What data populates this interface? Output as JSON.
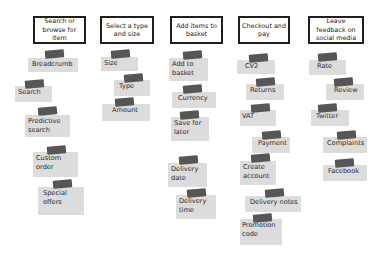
{
  "columns": [
    {
      "header": "Search or browse for item",
      "cards": [
        "Breadcrumb",
        "Search",
        "Predictive search",
        "Custom order",
        "Special offers"
      ]
    },
    {
      "header": "Select a type and size",
      "cards": [
        "Size",
        "Type",
        "Amount"
      ]
    },
    {
      "header": "Add items to basket",
      "cards": [
        "Add to basket",
        "Currency",
        "Save for later",
        "Delivery date",
        "Delivery time"
      ]
    },
    {
      "header": "Checkout and pay",
      "cards": [
        "CV2",
        "Returns",
        "VAT",
        "Payment",
        "Create account",
        "Delivery notes",
        "Promotion code"
      ]
    },
    {
      "header": "Leave feedback on social media",
      "cards": [
        "Rate",
        "Review",
        "Twitter",
        "Complaints",
        "Facebook"
      ]
    }
  ],
  "colors": {
    "header_border": "#1e1e1e",
    "sticky": "#dcdcdc",
    "tape": "#565656"
  }
}
